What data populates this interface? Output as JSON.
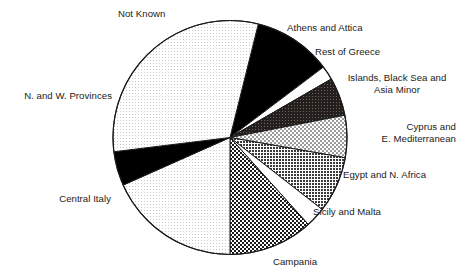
{
  "chart_data": {
    "type": "pie",
    "title": "",
    "subtitle": "",
    "xlabel": "",
    "ylabel": "",
    "legend_position": "callout-labels",
    "grid": false,
    "units": "percent of total",
    "start_angle_deg": 14,
    "direction": "clockwise",
    "center": {
      "x": 230,
      "y": 137.5
    },
    "radius": 117,
    "categories": [
      "Athens and Attica",
      "Rest of Greece",
      "Islands, Black Sea and Asia Minor",
      "Cyprus and E. Mediterranean",
      "Egypt and N. Africa",
      "Sicily and Malta",
      "Campania",
      "Central Italy",
      "N. and W. Provinces",
      "Not Known"
    ],
    "values": [
      10.8,
      1.9,
      5.3,
      5.8,
      7.8,
      2.8,
      11.7,
      18.3,
      4.7,
      30.9
    ],
    "slices": [
      {
        "label": "Athens and Attica",
        "value": 10.8,
        "start_deg": 14,
        "end_deg": 53,
        "fill_pattern": "solid-black",
        "fill_color": "#000000"
      },
      {
        "label": "Rest of Greece",
        "value": 1.9,
        "start_deg": 53,
        "end_deg": 60,
        "fill_pattern": "white",
        "fill_color": "#ffffff"
      },
      {
        "label": "Islands, Black Sea and Asia Minor",
        "value": 5.3,
        "start_deg": 60,
        "end_deg": 79,
        "fill_pattern": "dark-crosshatch",
        "fill_color": "#2c2724"
      },
      {
        "label": "Cyprus and E. Mediterranean",
        "value": 5.8,
        "start_deg": 79,
        "end_deg": 100,
        "fill_pattern": "light-checker",
        "fill_color": "#d8d8d8"
      },
      {
        "label": "Egypt and N. Africa",
        "value": 7.8,
        "start_deg": 100,
        "end_deg": 128,
        "fill_pattern": "medium-dots",
        "fill_color": "#8a8a8a"
      },
      {
        "label": "Sicily and Malta",
        "value": 2.8,
        "start_deg": 128,
        "end_deg": 138,
        "fill_pattern": "white",
        "fill_color": "#ffffff"
      },
      {
        "label": "Campania",
        "value": 11.7,
        "start_deg": 138,
        "end_deg": 180,
        "fill_pattern": "bold-checkerboard",
        "fill_color": "#9a9a9a"
      },
      {
        "label": "Central Italy",
        "value": 18.3,
        "start_deg": 180,
        "end_deg": 246,
        "fill_pattern": "very-light-dots",
        "fill_color": "#f2f2f2"
      },
      {
        "label": "N. and W. Provinces",
        "value": 4.7,
        "start_deg": 246,
        "end_deg": 263,
        "fill_pattern": "solid-black",
        "fill_color": "#000000"
      },
      {
        "label": "Not Known",
        "value": 30.9,
        "start_deg": 263,
        "end_deg": 374,
        "fill_pattern": "very-light-dots",
        "fill_color": "#f2f2f2"
      }
    ]
  },
  "labels": {
    "not_known": "Not Known",
    "athens_and_attica": "Athens and Attica",
    "rest_of_greece": "Rest of Greece",
    "islands_black_sea": "Islands, Black Sea and\nAsia Minor",
    "cyprus_e_mediterranean": "Cyprus and\n   E. Mediterranean",
    "egypt_n_africa": "Egypt and N. Africa",
    "sicily_and_malta": "Sicily and Malta",
    "campania": "Campania",
    "central_italy": "Central Italy",
    "n_and_w_provinces": "N. and W. Provinces"
  },
  "colors": {
    "outline": "#1a1a1a",
    "text": "#1a1a1a",
    "background": "#ffffff",
    "black_slice": "#000000",
    "dark_hatch": "#2c2724"
  }
}
